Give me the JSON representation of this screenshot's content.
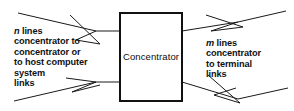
{
  "diagram": {
    "type": "block-diagram",
    "background_color": "#ffffff",
    "line_color": "#1a1a1a",
    "text_color": "#111111",
    "box": {
      "label": "Concentrator",
      "x": 119,
      "y": 12,
      "width": 63,
      "height": 89,
      "border_width": 2
    },
    "left_annotation": {
      "variable": "n",
      "lines": [
        "lines",
        "concentrator to",
        "concentrator or",
        "to host computer",
        "system",
        "links"
      ]
    },
    "right_annotation": {
      "variable": "m",
      "lines": [
        "lines",
        "concentrator",
        "to terminal",
        "links"
      ]
    },
    "connectors": [
      {
        "name": "top-left-inbound",
        "side": "left",
        "direction": "into-box",
        "entry_y": 31
      },
      {
        "name": "bottom-left-inbound",
        "side": "left",
        "direction": "into-box",
        "entry_y": 82
      },
      {
        "name": "top-right-outbound",
        "side": "right",
        "direction": "out-of-box",
        "exit_y": 31
      },
      {
        "name": "bottom-right-outbound",
        "side": "right",
        "direction": "out-of-box",
        "exit_y": 82
      }
    ]
  }
}
